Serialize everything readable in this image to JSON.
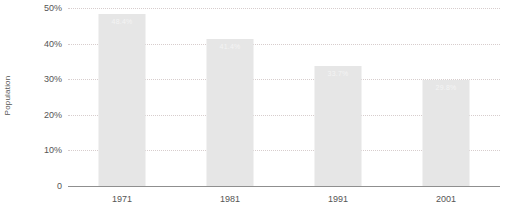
{
  "chart_data": {
    "type": "bar",
    "title": "",
    "subtitle": "",
    "xlabel": "",
    "ylabel": "Population",
    "categories": [
      "1971",
      "1981",
      "1991",
      "2001"
    ],
    "values": [
      48.4,
      41.4,
      33.7,
      29.8
    ],
    "value_labels": [
      "48.4%",
      "41.4%",
      "33.7%",
      "29.8%"
    ],
    "ylim": [
      0,
      50
    ],
    "y_ticks": [
      0,
      10,
      20,
      30,
      40,
      50
    ],
    "y_tick_labels": [
      "0",
      "10%",
      "20%",
      "30%",
      "40%",
      "50%"
    ],
    "grid": true,
    "grid_style": "dotted",
    "legend": false,
    "legend_position": "none",
    "orientation": "vertical",
    "colors": {
      "bar_fill": "#e6e6e6",
      "gridline": "#d7cdcd",
      "axis_line": "#8f8f8f",
      "tick_text": "#555555",
      "value_label_text": "#f4f4f4",
      "background": "#ffffff"
    }
  }
}
